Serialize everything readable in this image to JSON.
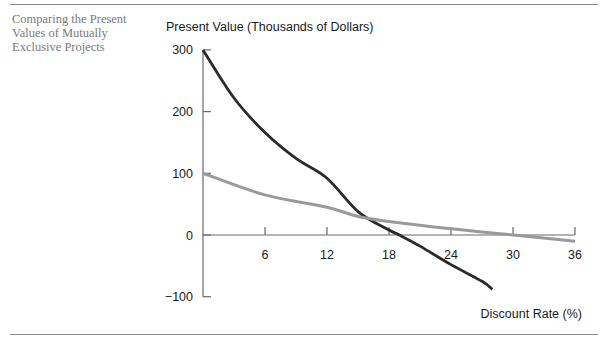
{
  "caption": "Comparing the Present\nValues of Mutually\nExclusive Projects",
  "chart_data": {
    "type": "line",
    "title": "Comparing the Present Values of Mutually Exclusive Projects",
    "ylabel": "Present Value (Thousands of Dollars)",
    "xlabel": "Discount Rate (%)",
    "x_ticks": [
      6,
      12,
      18,
      24,
      30,
      36
    ],
    "y_ticks": [
      300,
      200,
      100,
      0,
      -100
    ],
    "xlim": [
      0,
      36
    ],
    "ylim": [
      -100,
      300
    ],
    "grid": false,
    "legend": "none",
    "series": [
      {
        "name": "Project A (dark)",
        "color": "#2a2a2a",
        "x": [
          0,
          3,
          6,
          9,
          12,
          15,
          18,
          19,
          21,
          24,
          27,
          28
        ],
        "values": [
          300,
          222,
          166,
          124,
          92,
          38,
          8,
          0,
          -18,
          -48,
          -75,
          -88
        ]
      },
      {
        "name": "Project B (gray)",
        "color": "#9a9a9a",
        "x": [
          0,
          6,
          12,
          15,
          18,
          24,
          30,
          36
        ],
        "values": [
          100,
          65,
          45,
          30,
          22,
          10,
          0,
          -10
        ]
      }
    ]
  }
}
